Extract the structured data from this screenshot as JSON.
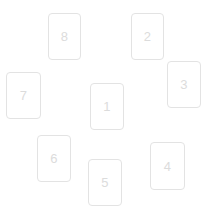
{
  "canvas": {
    "width": 213,
    "height": 211,
    "background_color": "#ffffff"
  },
  "card_style": {
    "width": 34,
    "height": 47,
    "fill_color": "#ffffff",
    "border_color": "#e3e3e3",
    "border_radius": 4,
    "label_color": "#dcdcdc",
    "label_font_size": 13
  },
  "cards": [
    {
      "label": "8",
      "x": 48,
      "y": 13,
      "width": 33,
      "height": 47
    },
    {
      "label": "2",
      "x": 131,
      "y": 13,
      "width": 33,
      "height": 47
    },
    {
      "label": "3",
      "x": 167,
      "y": 61,
      "width": 34,
      "height": 47
    },
    {
      "label": "7",
      "x": 6,
      "y": 72,
      "width": 35,
      "height": 47
    },
    {
      "label": "1",
      "x": 90,
      "y": 83,
      "width": 34,
      "height": 47
    },
    {
      "label": "6",
      "x": 37,
      "y": 135,
      "width": 34,
      "height": 47
    },
    {
      "label": "4",
      "x": 150,
      "y": 142,
      "width": 35,
      "height": 48
    },
    {
      "label": "5",
      "x": 88,
      "y": 159,
      "width": 34,
      "height": 47
    }
  ]
}
